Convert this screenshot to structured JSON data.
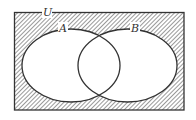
{
  "diagram": {
    "type": "venn",
    "universe_label": "U",
    "sets": [
      {
        "name": "A",
        "label": "A"
      },
      {
        "name": "B",
        "label": "B"
      }
    ],
    "shaded_region": "complement of (A ∪ B)",
    "colors": {
      "stroke": "#333333",
      "hatch": "#555555",
      "background": "#ffffff"
    }
  }
}
